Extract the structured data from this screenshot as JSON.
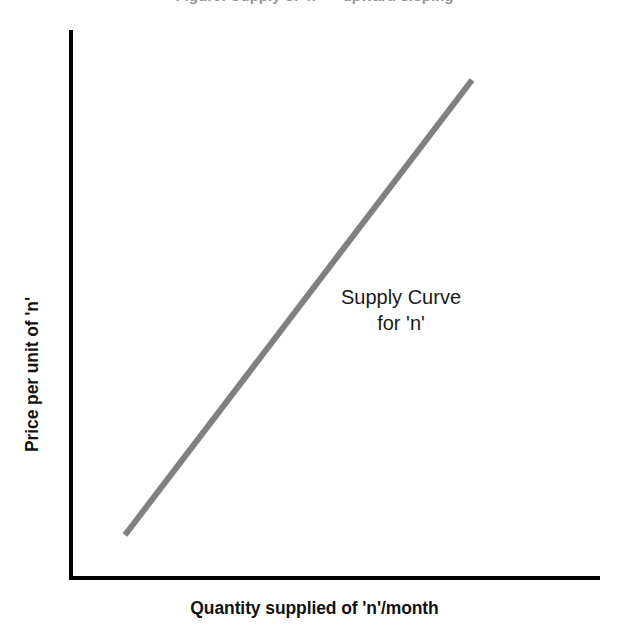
{
  "figure": {
    "background_color": "#ffffff",
    "top_caption_remnant": "Figure: Supply of 'n' — upward sloping"
  },
  "axes": {
    "color": "#000000",
    "y_axis": {
      "label": "Price per unit of 'n'",
      "x_px": 71,
      "top_px": 30,
      "bottom_px": 578
    },
    "x_axis": {
      "label": "Quantity supplied of 'n'/month",
      "y_px": 578,
      "left_px": 71,
      "right_px": 600
    }
  },
  "annotation": {
    "line1": "Supply Curve",
    "line2": "for 'n'",
    "color": "#1a1a1a"
  },
  "chart_data": {
    "type": "line",
    "title": "",
    "xlabel": "Quantity supplied of 'n'/month",
    "ylabel": "Price per unit of 'n'",
    "grid": false,
    "legend": "none",
    "axis_ticks": [],
    "xlim": [
      0,
      1
    ],
    "ylim": [
      0,
      1
    ],
    "series": [
      {
        "name": "Supply Curve for 'n'",
        "color": "#808080",
        "line_width_px": 6,
        "style": "straight-upward-sloping",
        "points_px": [
          {
            "x": 125,
            "y": 535
          },
          {
            "x": 472,
            "y": 80
          }
        ],
        "points_normalized": [
          {
            "x": 0.1,
            "y": 0.08
          },
          {
            "x": 0.76,
            "y": 0.91
          }
        ]
      }
    ]
  }
}
